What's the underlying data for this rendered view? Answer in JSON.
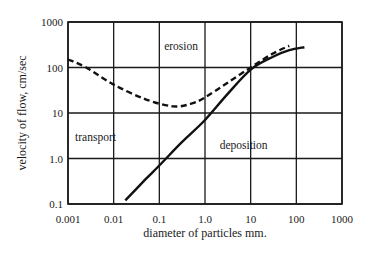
{
  "chart_data": {
    "type": "line",
    "title": "",
    "xlabel": "diameter of particles mm.",
    "ylabel": "velocity of flow, cm/sec",
    "xscale": "log",
    "yscale": "log",
    "xlim": [
      0.001,
      1000
    ],
    "ylim": [
      0.1,
      1000
    ],
    "grid": true,
    "x_tick_labels": [
      "0.001",
      "0.01",
      "0.1",
      "1.0",
      "10",
      "100",
      "1000"
    ],
    "y_tick_labels": [
      "0.1",
      "1.0",
      "10",
      "100",
      "1000"
    ],
    "series": [
      {
        "name": "erosion threshold",
        "style": "dashed",
        "x": [
          0.001,
          0.0025,
          0.01,
          0.05,
          0.2,
          0.5,
          1.0,
          3.0,
          10,
          30,
          70
        ],
        "y": [
          150,
          100,
          42,
          20,
          14,
          16,
          22,
          45,
          100,
          200,
          300
        ]
      },
      {
        "name": "deposition threshold",
        "style": "solid",
        "x": [
          0.018,
          0.05,
          0.1,
          0.3,
          1.0,
          3.0,
          10,
          30,
          70,
          150
        ],
        "y": [
          0.12,
          0.35,
          0.7,
          2.2,
          7,
          25,
          90,
          170,
          240,
          280
        ]
      }
    ],
    "annotations": [
      {
        "text": "erosion",
        "x": 0.3,
        "y": 300
      },
      {
        "text": "transport",
        "x": 0.004,
        "y": 3
      },
      {
        "text": "deposition",
        "x": 7,
        "y": 2
      }
    ],
    "legend": "none"
  }
}
